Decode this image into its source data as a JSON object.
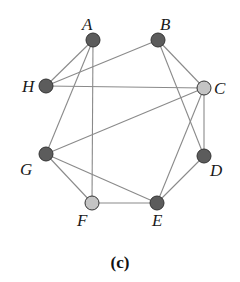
{
  "figure": {
    "caption": "(c)",
    "colors": {
      "dark_node": "#5c5c5c",
      "light_node": "#c4c4c4",
      "edge": "#8a8a8a"
    },
    "nodes": [
      {
        "id": "A",
        "label": "A",
        "x": 93,
        "y": 40,
        "shade": "dark",
        "lx": 82,
        "ly": 30
      },
      {
        "id": "B",
        "label": "B",
        "x": 158,
        "y": 40,
        "shade": "dark",
        "lx": 160,
        "ly": 30
      },
      {
        "id": "C",
        "label": "C",
        "x": 204,
        "y": 88,
        "shade": "light",
        "lx": 214,
        "ly": 94
      },
      {
        "id": "D",
        "label": "D",
        "x": 204,
        "y": 156,
        "shade": "dark",
        "lx": 210,
        "ly": 176
      },
      {
        "id": "E",
        "label": "E",
        "x": 157,
        "y": 203,
        "shade": "dark",
        "lx": 152,
        "ly": 226
      },
      {
        "id": "F",
        "label": "F",
        "x": 92,
        "y": 203,
        "shade": "light",
        "lx": 77,
        "ly": 226
      },
      {
        "id": "G",
        "label": "G",
        "x": 46,
        "y": 154,
        "shade": "dark",
        "lx": 20,
        "ly": 175
      },
      {
        "id": "H",
        "label": "H",
        "x": 46,
        "y": 86,
        "shade": "dark",
        "lx": 22,
        "ly": 92
      }
    ],
    "edges": [
      [
        "A",
        "H"
      ],
      [
        "A",
        "G"
      ],
      [
        "A",
        "F"
      ],
      [
        "B",
        "H"
      ],
      [
        "B",
        "C"
      ],
      [
        "B",
        "D"
      ],
      [
        "H",
        "C"
      ],
      [
        "C",
        "G"
      ],
      [
        "C",
        "D"
      ],
      [
        "C",
        "E"
      ],
      [
        "D",
        "E"
      ],
      [
        "G",
        "F"
      ],
      [
        "G",
        "E"
      ],
      [
        "F",
        "E"
      ]
    ]
  }
}
